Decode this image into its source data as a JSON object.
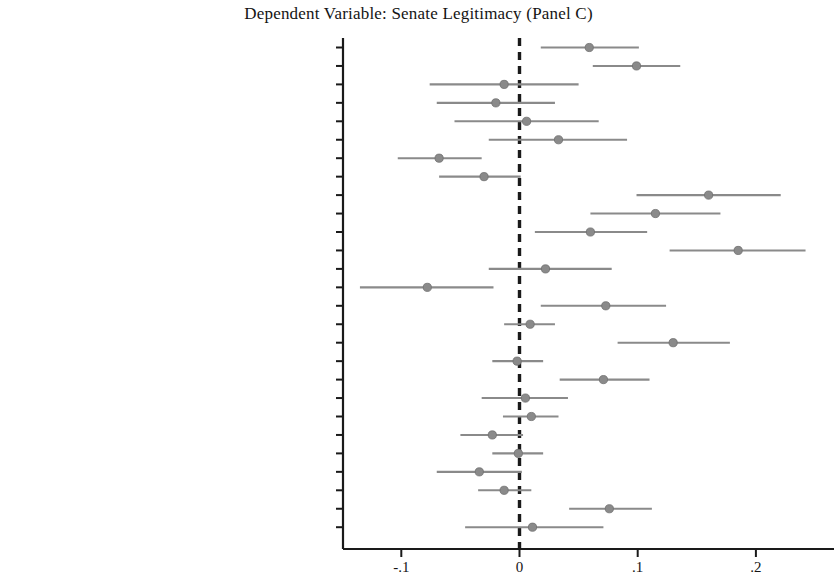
{
  "chart_data": {
    "type": "scatter",
    "subtype": "coefficient-plot-with-confidence-intervals",
    "title": "Dependent Variable: Senate Legitimacy (Panel C)",
    "xlabel": "",
    "ylabel": "",
    "xlim": [
      -0.14,
      0.27
    ],
    "xticks": [
      -0.1,
      0,
      0.1,
      0.2
    ],
    "xticklabels": [
      "-.1",
      "0",
      ".1",
      ".2"
    ],
    "grid": false,
    "legend": null,
    "reference_line": {
      "value": 0,
      "style": "dashed",
      "color": "#1a1a1a"
    },
    "marker_color": "#8a8a8a",
    "ci_color": "#8a8a8a",
    "categories": [
      "Awareness of Barrett confirmation",
      "Evaluation of Barrett confirmation",
      "Awareness of Trump actions",
      "Evaluation of Trump actions",
      "Awarness of election controversy",
      "Election fairness judgments",
      "Belief that Republicans threaten democracy",
      "Belief that Democrats threaten democracy",
      "Support for the rule of law",
      "Valuation of individual liberty",
      "Support for civil liberties",
      "Open-mindedness",
      "Party identification",
      "Ideological identification",
      "Political knowledge",
      "Gender",
      "Age",
      "Minority race",
      "Level of education",
      "Income",
      "Homeownership",
      "Metropolitan residence",
      "Resident of the South",
      "Internet access",
      "Born-again",
      "Church attendance",
      "U.S. citizen"
    ],
    "points": [
      {
        "label": "Awareness of Barrett confirmation",
        "estimate": 0.059,
        "ci_low": 0.018,
        "ci_high": 0.101
      },
      {
        "label": "Evaluation of Barrett confirmation",
        "estimate": 0.099,
        "ci_low": 0.062,
        "ci_high": 0.136
      },
      {
        "label": "Awareness of Trump actions",
        "estimate": -0.013,
        "ci_low": -0.076,
        "ci_high": 0.05
      },
      {
        "label": "Evaluation of Trump actions",
        "estimate": -0.02,
        "ci_low": -0.07,
        "ci_high": 0.03
      },
      {
        "label": "Awarness of election controversy",
        "estimate": 0.006,
        "ci_low": -0.055,
        "ci_high": 0.067
      },
      {
        "label": "Election fairness judgments",
        "estimate": 0.033,
        "ci_low": -0.026,
        "ci_high": 0.091
      },
      {
        "label": "Belief that Republicans threaten democracy",
        "estimate": -0.068,
        "ci_low": -0.103,
        "ci_high": -0.032
      },
      {
        "label": "Belief that Democrats threaten democracy",
        "estimate": -0.03,
        "ci_low": -0.068,
        "ci_high": 0.001
      },
      {
        "label": "Support for the rule of law",
        "estimate": 0.16,
        "ci_low": 0.099,
        "ci_high": 0.221
      },
      {
        "label": "Valuation of individual liberty",
        "estimate": 0.115,
        "ci_low": 0.06,
        "ci_high": 0.17
      },
      {
        "label": "Support for civil liberties",
        "estimate": 0.06,
        "ci_low": 0.013,
        "ci_high": 0.108
      },
      {
        "label": "Open-mindedness",
        "estimate": 0.185,
        "ci_low": 0.127,
        "ci_high": 0.242
      },
      {
        "label": "Party identification",
        "estimate": 0.022,
        "ci_low": -0.026,
        "ci_high": 0.078
      },
      {
        "label": "Ideological identification",
        "estimate": -0.078,
        "ci_low": -0.135,
        "ci_high": -0.022
      },
      {
        "label": "Political knowledge",
        "estimate": 0.073,
        "ci_low": 0.018,
        "ci_high": 0.124
      },
      {
        "label": "Gender",
        "estimate": 0.009,
        "ci_low": -0.013,
        "ci_high": 0.03
      },
      {
        "label": "Age",
        "estimate": 0.13,
        "ci_low": 0.083,
        "ci_high": 0.178
      },
      {
        "label": "Minority race",
        "estimate": -0.002,
        "ci_low": -0.023,
        "ci_high": 0.02
      },
      {
        "label": "Level of education",
        "estimate": 0.071,
        "ci_low": 0.034,
        "ci_high": 0.11
      },
      {
        "label": "Income",
        "estimate": 0.005,
        "ci_low": -0.032,
        "ci_high": 0.041
      },
      {
        "label": "Homeownership",
        "estimate": 0.01,
        "ci_low": -0.014,
        "ci_high": 0.033
      },
      {
        "label": "Metropolitan residence",
        "estimate": -0.023,
        "ci_low": -0.05,
        "ci_high": 0.003
      },
      {
        "label": "Resident of the South",
        "estimate": -0.001,
        "ci_low": -0.023,
        "ci_high": 0.02
      },
      {
        "label": "Internet access",
        "estimate": -0.034,
        "ci_low": -0.07,
        "ci_high": 0.002
      },
      {
        "label": "Born-again",
        "estimate": -0.013,
        "ci_low": -0.035,
        "ci_high": 0.01
      },
      {
        "label": "Church attendance",
        "estimate": 0.076,
        "ci_low": 0.042,
        "ci_high": 0.112
      },
      {
        "label": "U.S. citizen",
        "estimate": 0.011,
        "ci_low": -0.046,
        "ci_high": 0.071
      }
    ]
  }
}
